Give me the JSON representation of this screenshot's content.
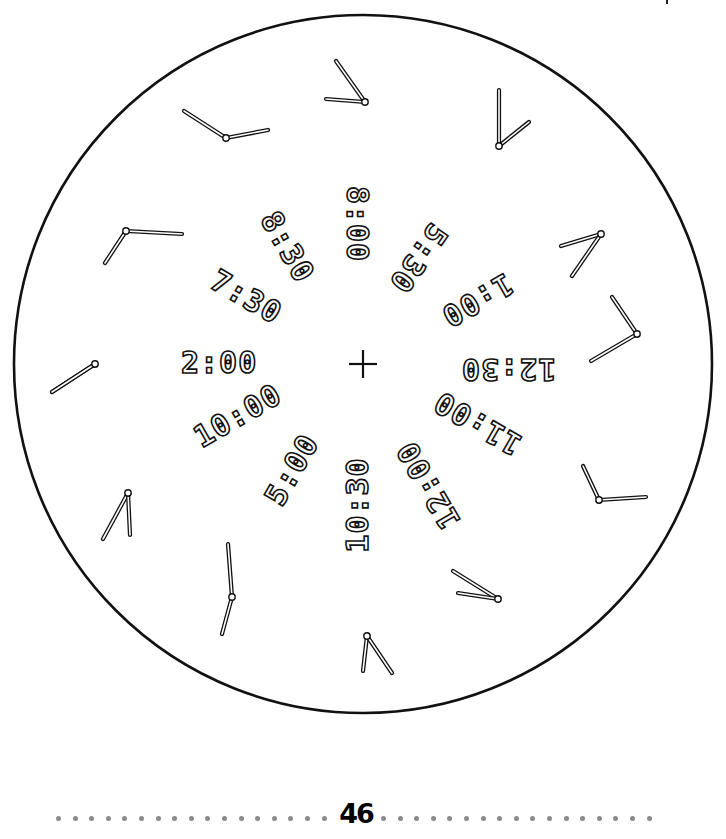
{
  "page": {
    "number": "46",
    "footer_left_dots": 17,
    "footer_right_dots": 17
  },
  "face": {
    "center": [
      363,
      364
    ],
    "radius": 349,
    "center_mark": "plus-icon",
    "stroke_color": "#111111"
  },
  "digital_times": [
    {
      "text": "8:00",
      "x": 357,
      "y": 224,
      "rotate": 90
    },
    {
      "text": "5:30",
      "x": 418,
      "y": 258,
      "rotate": 125
    },
    {
      "text": "1:00",
      "x": 477,
      "y": 300,
      "rotate": 150
    },
    {
      "text": "12:30",
      "x": 508,
      "y": 369,
      "rotate": 180
    },
    {
      "text": "11:00",
      "x": 477,
      "y": 423,
      "rotate": 210
    },
    {
      "text": "12:00",
      "x": 428,
      "y": 485,
      "rotate": 240
    },
    {
      "text": "10:30",
      "x": 357,
      "y": 505,
      "rotate": 270
    },
    {
      "text": "5:00",
      "x": 292,
      "y": 470,
      "rotate": -60
    },
    {
      "text": "10:00",
      "x": 237,
      "y": 416,
      "rotate": -30
    },
    {
      "text": "2:00",
      "x": 219,
      "y": 363,
      "rotate": 0
    },
    {
      "text": "7:30",
      "x": 246,
      "y": 297,
      "rotate": 30
    },
    {
      "text": "8:30",
      "x": 287,
      "y": 247,
      "rotate": 60
    }
  ],
  "analog_clocks": [
    {
      "pivot": [
        365,
        102
      ],
      "hands": [
        [
          336,
          61
        ],
        [
          326,
          99
        ]
      ]
    },
    {
      "pivot": [
        499,
        146
      ],
      "hands": [
        [
          499,
          90
        ],
        [
          529,
          122
        ]
      ]
    },
    {
      "pivot": [
        226,
        138
      ],
      "hands": [
        [
          184,
          111
        ],
        [
          268,
          130
        ]
      ]
    },
    {
      "pivot": [
        126,
        231
      ],
      "hands": [
        [
          105,
          263
        ],
        [
          182,
          234
        ]
      ]
    },
    {
      "pivot": [
        601,
        234
      ],
      "hands": [
        [
          561,
          246
        ],
        [
          572,
          276
        ]
      ]
    },
    {
      "pivot": [
        637,
        334
      ],
      "hands": [
        [
          612,
          297
        ],
        [
          591,
          361
        ]
      ]
    },
    {
      "pivot": [
        95,
        364
      ],
      "hands": [
        [
          52,
          392
        ],
        [
          52,
          392
        ]
      ]
    },
    {
      "pivot": [
        599,
        500
      ],
      "hands": [
        [
          583,
          466
        ],
        [
          646,
          497
        ]
      ]
    },
    {
      "pivot": [
        128,
        493
      ],
      "hands": [
        [
          103,
          539
        ],
        [
          130,
          535
        ]
      ]
    },
    {
      "pivot": [
        232,
        597
      ],
      "hands": [
        [
          228,
          544
        ],
        [
          222,
          634
        ]
      ]
    },
    {
      "pivot": [
        498,
        599
      ],
      "hands": [
        [
          453,
          571
        ],
        [
          458,
          593
        ]
      ]
    },
    {
      "pivot": [
        367,
        636
      ],
      "hands": [
        [
          363,
          671
        ],
        [
          392,
          673
        ]
      ]
    }
  ]
}
